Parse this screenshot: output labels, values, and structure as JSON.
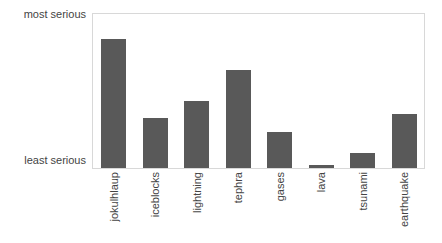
{
  "chart_data": {
    "type": "bar",
    "title": "",
    "xlabel": "",
    "ylabel": "",
    "grid": false,
    "legend": false,
    "categories": [
      "jokulhlaup",
      "iceblocks",
      "lightning",
      "tephra",
      "gases",
      "lava",
      "tsunami",
      "earthquake"
    ],
    "values": [
      0.83,
      0.32,
      0.43,
      0.63,
      0.23,
      0.02,
      0.1,
      0.35
    ],
    "ylim": [
      0,
      1
    ],
    "ytick_labels": [
      "least serious",
      "most serious"
    ],
    "ytick_values": [
      0,
      1
    ],
    "bar_color": "#595959",
    "frame_color": "#d8d8d8",
    "text_color": "#444444",
    "background": "#ffffff"
  },
  "axis": {
    "y_top_label": "most serious",
    "y_bottom_label": "least serious"
  }
}
